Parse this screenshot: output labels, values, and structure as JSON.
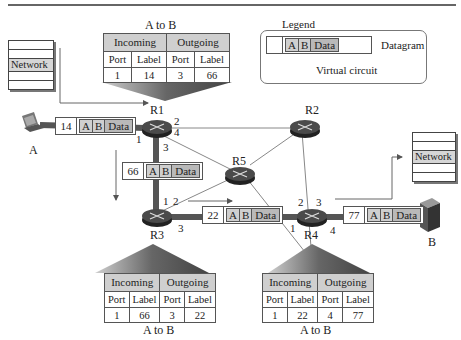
{
  "figure": {
    "legend": {
      "title": "Legend",
      "datagram_label": "Datagram",
      "virtual_circuit_label": "Virtual circuit",
      "packet_fields": [
        "A",
        "B",
        "Data"
      ]
    },
    "hosts": {
      "source": "A",
      "destination": "B"
    },
    "network_layer_label": "Network",
    "routers": [
      "R1",
      "R2",
      "R3",
      "R4",
      "R5"
    ],
    "ports": {
      "R1": [
        "1",
        "2",
        "3",
        "4"
      ],
      "R2": [],
      "R3": [
        "1",
        "2",
        "3"
      ],
      "R4": [
        "1",
        "2",
        "3",
        "4"
      ]
    },
    "packets": [
      {
        "label": "14",
        "fields": [
          "A",
          "B",
          "Data"
        ]
      },
      {
        "label": "66",
        "fields": [
          "A",
          "B",
          "Data"
        ]
      },
      {
        "label": "22",
        "fields": [
          "A",
          "B",
          "Data"
        ]
      },
      {
        "label": "77",
        "fields": [
          "A",
          "B",
          "Data"
        ]
      }
    ],
    "tables": {
      "r1": {
        "caption": "A to B",
        "incoming": "Incoming",
        "outgoing": "Outgoing",
        "cols": [
          "Port",
          "Label",
          "Port",
          "Label"
        ],
        "row": [
          "1",
          "14",
          "3",
          "66"
        ]
      },
      "r3": {
        "caption": "A to B",
        "incoming": "Incoming",
        "outgoing": "Outgoing",
        "cols": [
          "Port",
          "Label",
          "Port",
          "Label"
        ],
        "row": [
          "1",
          "66",
          "3",
          "22"
        ]
      },
      "r4": {
        "caption": "A to B",
        "incoming": "Incoming",
        "outgoing": "Outgoing",
        "cols": [
          "Port",
          "Label",
          "Port",
          "Label"
        ],
        "row": [
          "1",
          "22",
          "4",
          "77"
        ]
      }
    },
    "colors": {
      "virtual_circuit": "#555555",
      "router": "#3a3a3a",
      "header_fill": "#cfcfcf"
    }
  }
}
